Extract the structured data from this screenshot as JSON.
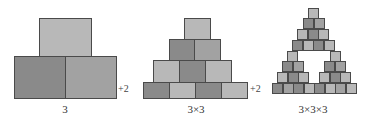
{
  "colors": {
    "light": "#b8b8b8",
    "mid": "#a2a2a2",
    "dark": "#8a8a8a",
    "border": "#4a4a4a"
  },
  "figures": [
    {
      "caption": "3",
      "caption_x": 65,
      "blocks": [
        {
          "x": 39,
          "y": 18,
          "w": 53,
          "h": 39,
          "shade": "light"
        },
        {
          "x": 14,
          "y": 56,
          "w": 52,
          "h": 43,
          "shade": "dark"
        },
        {
          "x": 65,
          "y": 56,
          "w": 52,
          "h": 43,
          "shade": "mid"
        }
      ]
    },
    {
      "caption": "3×3",
      "caption_x": 196,
      "blocks": [
        {
          "x": 184,
          "y": 18,
          "w": 27,
          "h": 22,
          "shade": "light"
        },
        {
          "x": 169,
          "y": 39,
          "w": 26,
          "h": 22,
          "shade": "dark"
        },
        {
          "x": 194,
          "y": 39,
          "w": 27,
          "h": 22,
          "shade": "mid"
        },
        {
          "x": 153,
          "y": 60,
          "w": 27,
          "h": 23,
          "shade": "light"
        },
        {
          "x": 179,
          "y": 60,
          "w": 27,
          "h": 23,
          "shade": "dark"
        },
        {
          "x": 205,
          "y": 60,
          "w": 27,
          "h": 23,
          "shade": "light"
        },
        {
          "x": 143,
          "y": 82,
          "w": 27,
          "h": 17,
          "shade": "dark"
        },
        {
          "x": 169,
          "y": 82,
          "w": 27,
          "h": 17,
          "shade": "light"
        },
        {
          "x": 195,
          "y": 82,
          "w": 27,
          "h": 17,
          "shade": "dark"
        },
        {
          "x": 221,
          "y": 82,
          "w": 27,
          "h": 17,
          "shade": "light"
        }
      ]
    },
    {
      "caption": "3×3×3",
      "caption_x": 313,
      "block_size": 11,
      "rows": [
        {
          "y": 8,
          "x0": 308,
          "shades": [
            "light"
          ]
        },
        {
          "y": 18,
          "x0": 303,
          "shades": [
            "dark",
            "mid"
          ]
        },
        {
          "y": 29,
          "x0": 297,
          "shades": [
            "light",
            "dark",
            "light"
          ]
        },
        {
          "y": 40,
          "x0": 292,
          "shades": [
            "dark",
            "light",
            "dark",
            "light"
          ]
        },
        {
          "y": 51,
          "x0": 287,
          "shades": [
            "light"
          ]
        },
        {
          "y": 51,
          "x0": 330,
          "shades": [
            "light"
          ]
        },
        {
          "y": 61,
          "x0": 282,
          "shades": [
            "dark",
            "mid"
          ]
        },
        {
          "y": 61,
          "x0": 324,
          "shades": [
            "dark",
            "mid"
          ]
        },
        {
          "y": 72,
          "x0": 277,
          "shades": [
            "light",
            "dark",
            "light"
          ]
        },
        {
          "y": 72,
          "x0": 319,
          "shades": [
            "light",
            "dark",
            "light"
          ]
        },
        {
          "y": 83,
          "x0": 272,
          "shades": [
            "dark",
            "mid",
            "dark",
            "light",
            "dark",
            "light",
            "mid",
            "light"
          ]
        }
      ]
    }
  ],
  "plus_labels": [
    {
      "text": "+2",
      "x": 118,
      "y": 83
    },
    {
      "text": "+2",
      "x": 250,
      "y": 83
    }
  ]
}
